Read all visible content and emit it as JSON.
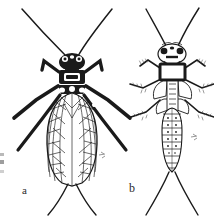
{
  "figure": {
    "kind": "scientific-illustration-plate",
    "background_color": "#ffffff",
    "ink_color": "#1a1a1a",
    "panels": [
      {
        "id": "a",
        "label": "a",
        "caption": "a",
        "stage": "adult",
        "description": "dorsal view of winged adult stonefly with long antennae, dark mottled head and pronotum, two pairs of membranous wings folded flat over abdomen, three pairs of banded legs, and two long cerci",
        "features": {
          "antennae": 2,
          "wings": 4,
          "legs": 6,
          "cerci": 2,
          "wing_veins_longitudinal": 9,
          "wing_crossveins": 14
        }
      },
      {
        "id": "b",
        "label": "b",
        "caption": "b",
        "stage": "nymph",
        "description": "dorsal view of aquatic stonefly nymph (naiad) with long antennae, broad head with paired eyes, rectangular outlined pronotum, developing wing pads, fringed legs, segmented abdomen and two long cerci",
        "features": {
          "antennae": 2,
          "wing_pads": 4,
          "legs": 6,
          "cerci": 2,
          "abdominal_segments": 10
        }
      }
    ],
    "edge_marks": {
      "present": true,
      "description": "faint grey cropped marks at left margin"
    }
  }
}
